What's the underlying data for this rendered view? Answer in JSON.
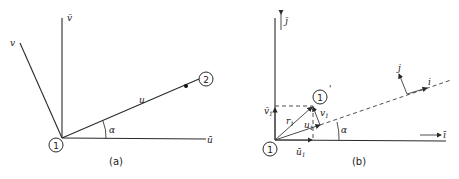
{
  "panels": [
    {
      "caption": "(a)",
      "labels": {
        "v_bar": "v̄",
        "v": "v",
        "u": "u",
        "u_bar": "ū",
        "alpha": "α",
        "node1": "1",
        "node2": "2"
      }
    },
    {
      "caption": "(b)",
      "labels": {
        "j_bar": "j̄",
        "i_bar": "ī",
        "j_local": "j",
        "i_local": "i",
        "alpha": "α",
        "node1": "1",
        "node1_prime": "1",
        "prime_mark": "'",
        "r1": "r",
        "r1_sub": "1",
        "u1": "u",
        "u1_sub": "1",
        "v1": "v",
        "v1_sub": "1",
        "u1_bar": "ū",
        "u1_bar_sub": "1",
        "v1_bar": "v̄",
        "v1_bar_sub": "1"
      }
    }
  ]
}
